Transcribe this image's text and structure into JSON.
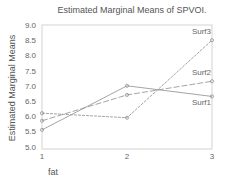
{
  "chart_data": {
    "type": "line",
    "title": "Estimated Marginal Means of SPVOI.",
    "xlabel": "fat",
    "ylabel": "Estimated Marginal Means",
    "x": [
      1,
      2,
      3
    ],
    "x_tick_labels": [
      "1",
      "2",
      "3"
    ],
    "y_tick_labels": [
      "9.0",
      "8.5",
      "8.0",
      "7.5",
      "7.0",
      "6.5",
      "6.0",
      "5.5",
      "5.0"
    ],
    "ylim": [
      4.8,
      9.0
    ],
    "grid": false,
    "legend_position": "inline labels at right end of lines",
    "series": [
      {
        "name": "Surf1",
        "values": [
          5.55,
          7.0,
          6.65
        ]
      },
      {
        "name": "Surf2",
        "values": [
          5.85,
          6.7,
          7.15
        ]
      },
      {
        "name": "Surf3",
        "values": [
          6.1,
          5.95,
          8.5
        ]
      }
    ],
    "line_color": "#9a9a9a"
  }
}
